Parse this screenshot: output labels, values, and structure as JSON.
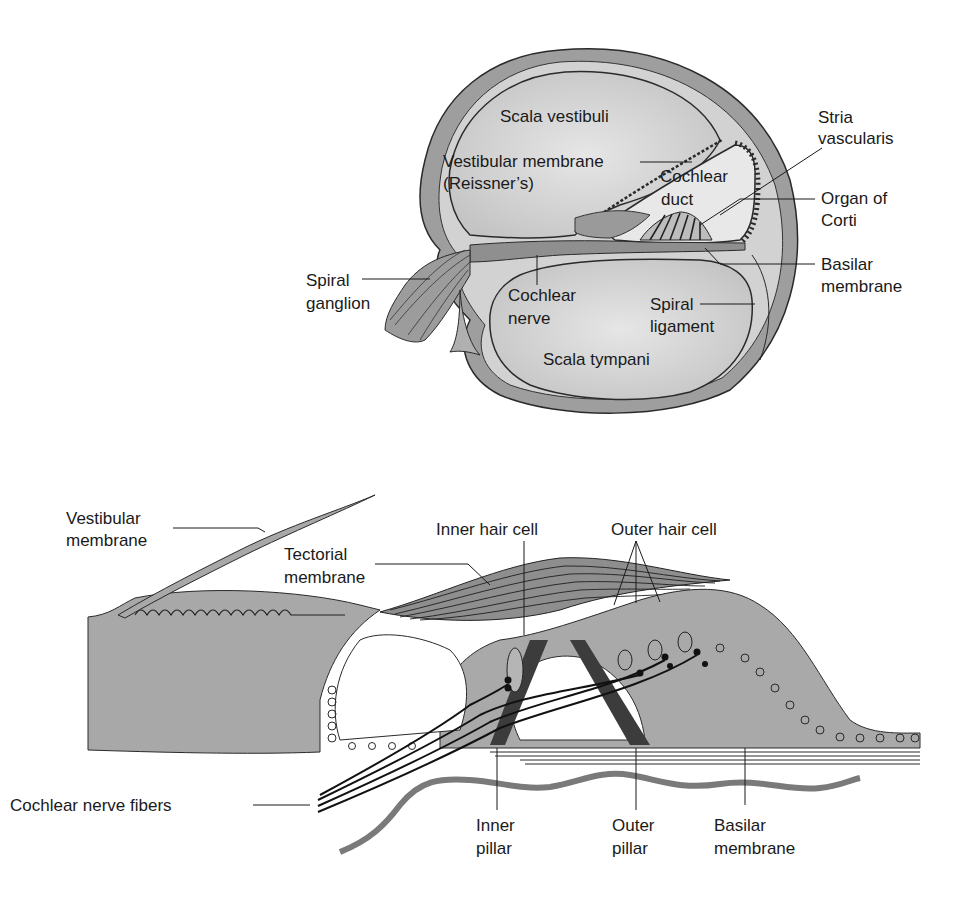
{
  "figure": {
    "top_panel": {
      "title": "Cochlea cross-section",
      "labels": {
        "scala_vestibuli": "Scala vestibuli",
        "vestibular_membrane_line1": "Vestibular membrane",
        "vestibular_membrane_line2": "(Reissner’s)",
        "cochlear_duct_line1": "Cochlear",
        "cochlear_duct_line2": "duct",
        "stria_vascularis_line1": "Stria",
        "stria_vascularis_line2": "vascularis",
        "organ_of_corti_line1": "Organ of",
        "organ_of_corti_line2": "Corti",
        "basilar_membrane_line1": "Basilar",
        "basilar_membrane_line2": "membrane",
        "spiral_ganglion_line1": "Spiral",
        "spiral_ganglion_line2": "ganglion",
        "cochlear_nerve_line1": "Cochlear",
        "cochlear_nerve_line2": "nerve",
        "spiral_ligament_line1": "Spiral",
        "spiral_ligament_line2": "ligament",
        "scala_tympani": "Scala tympani"
      }
    },
    "bottom_panel": {
      "title": "Organ of Corti detail",
      "labels": {
        "vestibular_membrane_line1": "Vestibular",
        "vestibular_membrane_line2": "membrane",
        "tectorial_membrane_line1": "Tectorial",
        "tectorial_membrane_line2": "membrane",
        "inner_hair_cell": "Inner hair cell",
        "outer_hair_cell": "Outer hair cell",
        "cochlear_nerve_fibers": "Cochlear nerve fibers",
        "inner_pillar_line1": "Inner",
        "inner_pillar_line2": "pillar",
        "outer_pillar_line1": "Outer",
        "outer_pillar_line2": "pillar",
        "basilar_membrane_line1": "Basilar",
        "basilar_membrane_line2": "membrane"
      }
    },
    "colors": {
      "tissue_gray": "#a9a9a9",
      "fluid_light": "#d6d6d6",
      "outline": "#2a2a2a",
      "dark_pillar": "#3c3c3c",
      "background": "#ffffff"
    }
  }
}
